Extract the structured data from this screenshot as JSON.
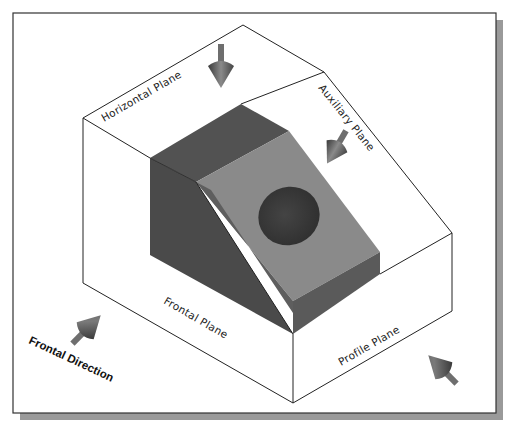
{
  "figure": {
    "colors": {
      "background": "#ffffff",
      "frame_border": "#333333",
      "frame_shadow": "#9a9a9a",
      "box_lines": "#222222",
      "part_dark": "#4a4a4a",
      "part_mid": "#5e5e5e",
      "part_light": "#8a8a8a",
      "hole": "#3c3c3c",
      "arrow_body": "#6e6e6e"
    },
    "planes": {
      "horizontal": "Horizontal Plane",
      "auxiliary": "Auxiliary Plane",
      "frontal": "Frontal Plane",
      "profile": "Profile Plane"
    },
    "directions": {
      "frontal": "Frontal Direction"
    },
    "arrows": [
      {
        "name": "top-view-arrow",
        "target": "Horizontal Plane"
      },
      {
        "name": "auxiliary-view-arrow",
        "target": "Auxiliary Plane"
      },
      {
        "name": "frontal-view-arrow",
        "target": "Frontal Plane"
      },
      {
        "name": "profile-view-arrow",
        "target": "Profile Plane"
      }
    ]
  }
}
